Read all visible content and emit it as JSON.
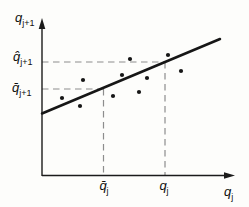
{
  "figure": {
    "colors": {
      "background": "#fdfdfb",
      "axis": "#1b1b1b",
      "fit_line": "#161616",
      "dashed_guide": "#8d8d8d",
      "point": "#161616",
      "text": "#101010"
    }
  },
  "labels": {
    "y_axis_title": {
      "base": "q",
      "sub": "j+1"
    },
    "x_axis_title": {
      "base": "q",
      "sub": "j"
    },
    "y_hat": {
      "base": "q̂",
      "sub": "j+1"
    },
    "y_mean": {
      "base": "q̄",
      "sub": "j+1"
    },
    "x_mean": {
      "base": "q̄",
      "sub": "j"
    },
    "x_obs": {
      "base": "q",
      "sub": "j"
    }
  },
  "chart_data": {
    "type": "scatter",
    "title": "",
    "xlabel": "q_j",
    "ylabel": "q_j+1",
    "axes_numeric": false,
    "legend": "none",
    "grid": "off",
    "points_px": [
      [
        62,
        98
      ],
      [
        80,
        106
      ],
      [
        83,
        80
      ],
      [
        113,
        96
      ],
      [
        122,
        75
      ],
      [
        130,
        59
      ],
      [
        139,
        92
      ],
      [
        147,
        78
      ],
      [
        168,
        55
      ],
      [
        181,
        71
      ]
    ],
    "fit_line_px": {
      "x1": 42,
      "y1": 113.5,
      "x2": 220,
      "y2": 39
    },
    "guides_px": {
      "y_hat": 62,
      "y_mean": 89,
      "x_mean": 103.5,
      "x_obs": 165,
      "axis_x": 42,
      "axis_y": 175.5
    }
  }
}
